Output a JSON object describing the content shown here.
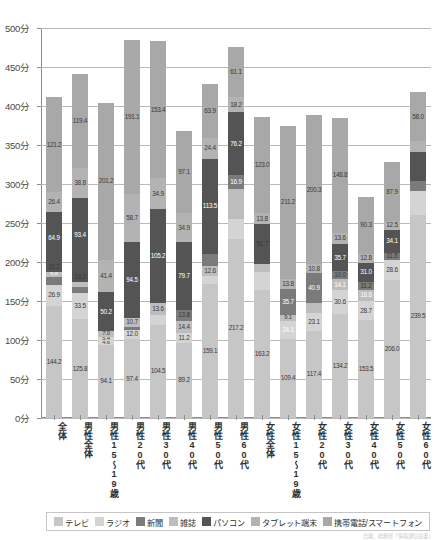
{
  "axis": {
    "unit_suffix": "分",
    "y_ticks": [
      "500分",
      "450分",
      "400分",
      "350分",
      "300分",
      "250分",
      "200分",
      "150分",
      "100分",
      "50分",
      "0分"
    ],
    "y_min": 0,
    "y_max": 500,
    "y_step": 50
  },
  "legend": {
    "items": [
      {
        "label": "テレビ",
        "color": "#c6c6c6"
      },
      {
        "label": "ラジオ",
        "color": "#d4d4d4"
      },
      {
        "label": "新聞",
        "color": "#7b7b7b"
      },
      {
        "label": "雑誌",
        "color": "#bdbdbd"
      },
      {
        "label": "パソコン",
        "color": "#545454"
      },
      {
        "label": "タブレット端末",
        "color": "#b3b3b3"
      },
      {
        "label": "携帯電話/スマートフォン",
        "color": "#a8a8a8"
      }
    ]
  },
  "footnote": "出典：総務省「情報通信白書」",
  "chart_data": {
    "type": "bar",
    "title": "",
    "xlabel": "",
    "ylabel": "分",
    "ylim": [
      0,
      500
    ],
    "grid": true,
    "legend_position": "bottom",
    "stacked": true,
    "categories": [
      "全体",
      "男性\n全体",
      "男性\n15\n～\n19\n歳",
      "男性\n20\n代",
      "男性\n30\n代",
      "男性\n40\n代",
      "男性\n50\n代",
      "男性\n60\n代",
      "女性\n全体",
      "女性\n15\n～\n19\n歳",
      "女性\n20\n代",
      "女性\n30\n代",
      "女性\n40\n代",
      "女性\n50\n代",
      "女性\n60\n代"
    ],
    "series": [
      {
        "name": "テレビ",
        "color": "#c6c6c6",
        "values": [
          144.2,
          125.8,
          94.1,
          97.4,
          104.5,
          89.2,
          159.1,
          217.2,
          163.2,
          109.4,
          117.4,
          134.2,
          153.5,
          206.0,
          239.5
        ]
      },
      {
        "name": "ラジオ",
        "color": "#d4d4d4",
        "values": [
          26.9,
          33.5,
          4.6,
          12.0,
          11.2,
          14.4,
          12.6,
          24.1,
          24.1,
          23.1,
          30.6,
          28.7,
          28.6,
          0,
          0
        ]
      },
      {
        "name": "新聞",
        "color": "#7b7b7b",
        "values": [
          9.8,
          5.5,
          5.4,
          10.5,
          11.2,
          11.2,
          9.0,
          24.1,
          9.1,
          9.7,
          14.1,
          18.6,
          0,
          0,
          0
        ]
      },
      {
        "name": "雑誌",
        "color": "#bdbdbd",
        "values": [
          11.2,
          13.2,
          7.0,
          10.7,
          13.8,
          13.8,
          12.6,
          35.7,
          35.7,
          37.7,
          10.0,
          11.2,
          0,
          0,
          0
        ]
      },
      {
        "name": "パソコン",
        "color": "#545454",
        "values": [
          64.9,
          93.4,
          50.2,
          94.5,
          105.2,
          79.7,
          113.5,
          76.2,
          51.7,
          40.9,
          35.7,
          31.0,
          0,
          0,
          0
        ]
      },
      {
        "name": "タブレット端末",
        "color": "#b3b3b3",
        "values": [
          26.4,
          38.8,
          41.4,
          58.7,
          34.9,
          34.9,
          24.4,
          16.9,
          13.8,
          10.8,
          13.6,
          12.8,
          11.5,
          34.1,
          12.5
        ]
      },
      {
        "name": "携帯電話/スマートフォン",
        "color": "#a8a8a8",
        "values": [
          121.2,
          119.4,
          201.2,
          191.1,
          153.4,
          97.1,
          63.9,
          61.1,
          123.0,
          211.2,
          200.3,
          148.8,
          90.3,
          87.9,
          58.0
        ]
      }
    ],
    "bar_stacks": [
      {
        "category": "全体",
        "total": 411.0,
        "segments": [
          {
            "series": "テレビ",
            "value": 144.2,
            "label": "144.2",
            "color": "#c6c6c6",
            "label_color": "dark"
          },
          {
            "series": "ラジオ",
            "value": 26.9,
            "label": "26.9",
            "color": "#d4d4d4",
            "label_color": "dark"
          },
          {
            "series": "新聞",
            "value": 9.8,
            "label": "9.8",
            "color": "#7b7b7b",
            "label_color": "light"
          },
          {
            "series": "雑誌",
            "value": 6.8,
            "label": "6.8",
            "color": "#bdbdbd",
            "label_color": "dark"
          },
          {
            "series": "パソコン",
            "value": 11.2,
            "label": "11.2",
            "color": "#545454",
            "label_color": "light"
          },
          {
            "series": "タブレット端末",
            "value": 64.9,
            "label": "64.9",
            "color": "#545454",
            "label_color": "light"
          },
          {
            "series": "携帯電話/スマートフォン",
            "value": 26.4,
            "label": "26.4",
            "color": "#b3b3b3",
            "label_color": "dark"
          },
          {
            "series": "携帯電話/スマートフォン",
            "value": 121.2,
            "label": "121.2",
            "color": "#a8a8a8",
            "label_color": "dark"
          }
        ]
      }
    ],
    "stack_totals": [
      411,
      441,
      404,
      485,
      483,
      368,
      428,
      476,
      386,
      375,
      388,
      385,
      284,
      328,
      418
    ]
  }
}
